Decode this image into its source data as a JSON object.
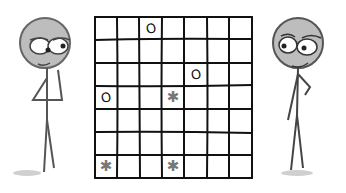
{
  "scene": {
    "description": "Two hand-drawn stick figures facing a 7x7 game grid",
    "left_character": {
      "name": "left-figure",
      "pose": "hand on chin, looking right"
    },
    "right_character": {
      "name": "right-figure",
      "pose": "hand on hip, looking left"
    }
  },
  "grid": {
    "rows": 7,
    "cols": 7,
    "marks": [
      {
        "row": 0,
        "col": 2,
        "symbol": "O"
      },
      {
        "row": 2,
        "col": 4,
        "symbol": "O"
      },
      {
        "row": 3,
        "col": 0,
        "symbol": "O"
      },
      {
        "row": 3,
        "col": 3,
        "symbol": "✱"
      },
      {
        "row": 6,
        "col": 0,
        "symbol": "✱"
      },
      {
        "row": 6,
        "col": 3,
        "symbol": "✱"
      }
    ]
  },
  "colors": {
    "ink": "#111111",
    "figure_line": "#555555",
    "head_fill": "#bdbdbd",
    "star": "#777777"
  }
}
